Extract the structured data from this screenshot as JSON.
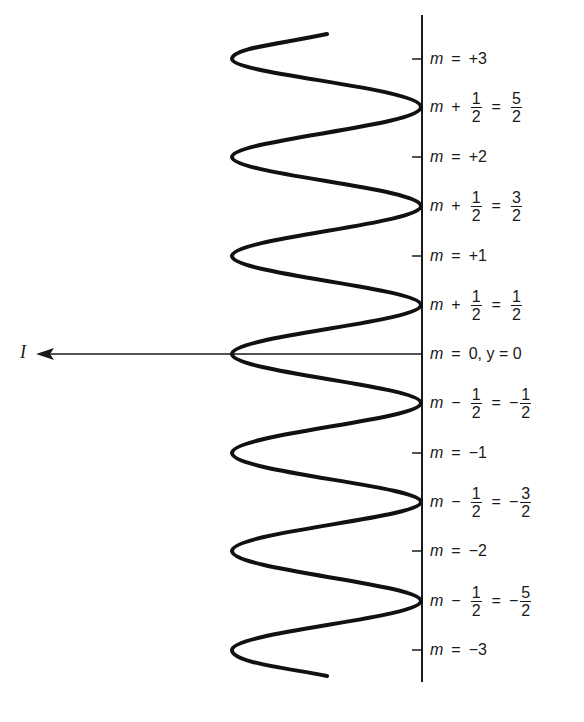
{
  "diagram": {
    "intensity_label": "I",
    "axis_color": "#1a1a1a",
    "wave_color": "#111111",
    "integer_levels": [
      {
        "lhs": "m",
        "rel": "=",
        "rhs": "+3"
      },
      {
        "lhs": "m",
        "rel": "=",
        "rhs": "+2"
      },
      {
        "lhs": "m",
        "rel": "=",
        "rhs": "+1"
      },
      {
        "lhs": "m",
        "rel": "=",
        "rhs": "0, y = 0"
      },
      {
        "lhs": "m",
        "rel": "=",
        "rhs": "−1"
      },
      {
        "lhs": "m",
        "rel": "=",
        "rhs": "−2"
      },
      {
        "lhs": "m",
        "rel": "=",
        "rhs": "−3"
      }
    ],
    "half_levels": [
      {
        "lhs": "m",
        "op": "+",
        "frac_num": "1",
        "frac_den": "2",
        "rel": "=",
        "sign": "",
        "res_num": "5",
        "res_den": "2"
      },
      {
        "lhs": "m",
        "op": "+",
        "frac_num": "1",
        "frac_den": "2",
        "rel": "=",
        "sign": "",
        "res_num": "3",
        "res_den": "2"
      },
      {
        "lhs": "m",
        "op": "+",
        "frac_num": "1",
        "frac_den": "2",
        "rel": "=",
        "sign": "",
        "res_num": "1",
        "res_den": "2"
      },
      {
        "lhs": "m",
        "op": "−",
        "frac_num": "1",
        "frac_den": "2",
        "rel": "=",
        "sign": "−",
        "res_num": "1",
        "res_den": "2"
      },
      {
        "lhs": "m",
        "op": "−",
        "frac_num": "1",
        "frac_den": "2",
        "rel": "=",
        "sign": "−",
        "res_num": "3",
        "res_den": "2"
      },
      {
        "lhs": "m",
        "op": "−",
        "frac_num": "1",
        "frac_den": "2",
        "rel": "=",
        "sign": "−",
        "res_num": "5",
        "res_den": "2"
      }
    ]
  }
}
